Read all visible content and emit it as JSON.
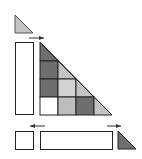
{
  "diagram": {
    "colors": {
      "dark": "#6e6e6e",
      "light": "#c4c4c4",
      "white": "#ffffff",
      "stroke": "#222222",
      "arrow": "#333333"
    },
    "top_triangle": {
      "fill": "light"
    },
    "grid": {
      "rows": 4,
      "cells": [
        [
          {
            "shape": "triangle",
            "fill": "dark"
          }
        ],
        [
          {
            "shape": "square",
            "fill": "dark"
          },
          {
            "shape": "triangle",
            "fill": "light"
          }
        ],
        [
          {
            "shape": "square",
            "fill": "dark"
          },
          {
            "shape": "square",
            "fill": "light"
          },
          {
            "shape": "triangle",
            "fill": "light"
          }
        ],
        [
          {
            "shape": "square",
            "fill": "white"
          },
          {
            "shape": "square",
            "fill": "light"
          },
          {
            "shape": "square",
            "fill": "dark"
          },
          {
            "shape": "triangle",
            "fill": "light"
          }
        ]
      ]
    },
    "bottom_triangle": {
      "fill": "dark"
    },
    "arrows": [
      {
        "name": "top-arrow",
        "direction": "right"
      },
      {
        "name": "bottom-left-arrow",
        "direction": "left"
      },
      {
        "name": "bottom-right-arrow",
        "direction": "right"
      }
    ]
  }
}
